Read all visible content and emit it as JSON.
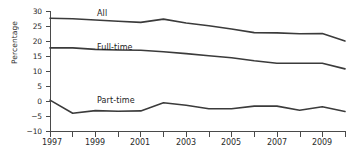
{
  "chart_data": {
    "type": "line",
    "title": "",
    "xlabel": "",
    "ylabel": "Percentage",
    "xlim": [
      1997,
      2010
    ],
    "ylim": [
      -10,
      30
    ],
    "ytick_values": [
      30,
      25,
      20,
      15,
      10,
      5,
      0,
      -5,
      -10
    ],
    "ytick_labels": [
      "30",
      "25",
      "20",
      "15",
      "10",
      "5",
      "0",
      "−5",
      "−10"
    ],
    "xtick_values": [
      1997,
      1998,
      1999,
      2000,
      2001,
      2002,
      2003,
      2004,
      2005,
      2006,
      2007,
      2008,
      2009,
      2010
    ],
    "xtick_labels_shown": [
      "1997",
      "1999",
      "2001",
      "2003",
      "2005",
      "2007",
      "2009"
    ],
    "grid": false,
    "legend": "inline-labels",
    "x": [
      1997,
      1998,
      1999,
      2000,
      2001,
      2002,
      2003,
      2004,
      2005,
      2006,
      2007,
      2008,
      2009,
      2010
    ],
    "series": [
      {
        "name": "All",
        "label": "All",
        "color": "#3b3b3b",
        "values": [
          27.6,
          27.4,
          27.0,
          26.6,
          26.2,
          27.3,
          26.0,
          25.1,
          24.0,
          22.8,
          22.7,
          22.4,
          22.5,
          20.0
        ]
      },
      {
        "name": "Full-time",
        "label": "Full-time",
        "color": "#3b3b3b",
        "values": [
          17.7,
          17.7,
          17.2,
          17.0,
          16.9,
          16.4,
          15.8,
          15.1,
          14.4,
          13.4,
          12.6,
          12.6,
          12.6,
          10.7
        ]
      },
      {
        "name": "Part-time",
        "label": "Part-time",
        "color": "#3b3b3b",
        "values": [
          0.3,
          -4.1,
          -3.2,
          -3.4,
          -3.3,
          -0.6,
          -1.4,
          -2.6,
          -2.6,
          -1.7,
          -1.7,
          -3.1,
          -1.9,
          -3.5
        ]
      }
    ],
    "annotations": [
      {
        "text": "All",
        "near_x": 2000,
        "near_y": 29.5
      },
      {
        "text": "Full-time",
        "near_x": 2000,
        "near_y": 20.0
      },
      {
        "text": "Part-time",
        "near_x": 2000,
        "near_y": 0.5
      }
    ]
  }
}
